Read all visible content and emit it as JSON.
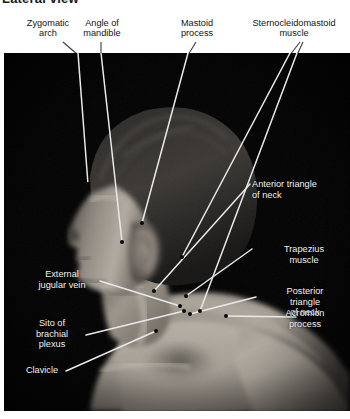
{
  "plate": {
    "title": "Lateral view",
    "type": "anatomical-photograph",
    "view": "right lateral / posterolateral head, neck and shoulder",
    "background_color": "#000000",
    "header_text_color": "#141414",
    "overlay_text_color": "#f2f2f2",
    "leader_line_color": "#e8e8e8",
    "leader_dot_color": "#000000"
  },
  "header_labels": [
    {
      "id": "zygomatic-arch",
      "text": "Zygomatic\narch"
    },
    {
      "id": "angle-of-mandible",
      "text": "Angle of\nmandible"
    },
    {
      "id": "mastoid-process",
      "text": "Mastoid\nprocess"
    },
    {
      "id": "sternocleidomastoid",
      "text": "Sternocleidomastoid\nmuscle"
    }
  ],
  "overlay_labels": [
    {
      "id": "anterior-triangle-of-neck",
      "text": "Anterior triangle\nof neck"
    },
    {
      "id": "trapezius-muscle",
      "text": "Trapezius\nmuscle"
    },
    {
      "id": "posterior-triangle-of-neck",
      "text": "Posterior\ntriangle\nof neck"
    },
    {
      "id": "acromion-process",
      "text": "Acromion\nprocess"
    },
    {
      "id": "external-jugular-vein",
      "text": "External\njugular vein"
    },
    {
      "id": "site-of-brachial-plexus",
      "text": "Sito of\nbrachial\nplexus"
    },
    {
      "id": "clavicle",
      "text": "Clavicle"
    }
  ]
}
